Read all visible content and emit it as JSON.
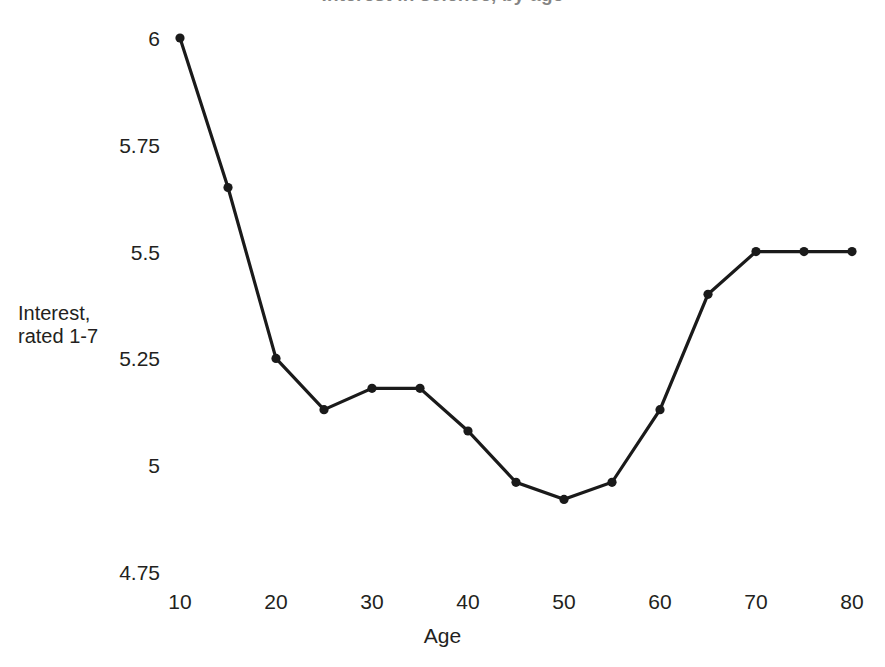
{
  "chart_data": {
    "type": "line",
    "title": "Interest in science, by age",
    "title_cropped": true,
    "xlabel": "Age",
    "ylabel": "Interest,\nrated 1-7",
    "ylabel_line1": "Interest,",
    "ylabel_line2": "rated 1-7",
    "x": [
      10,
      15,
      20,
      25,
      30,
      35,
      40,
      45,
      50,
      55,
      60,
      65,
      70,
      75,
      80
    ],
    "values": [
      6.0,
      5.65,
      5.25,
      5.13,
      5.18,
      5.18,
      5.08,
      4.96,
      4.92,
      4.96,
      5.13,
      5.4,
      5.5,
      5.5,
      5.5
    ],
    "series": [
      {
        "name": "Interest",
        "values": [
          6.0,
          5.65,
          5.25,
          5.13,
          5.18,
          5.18,
          5.08,
          4.96,
          4.92,
          4.96,
          5.13,
          5.4,
          5.5,
          5.5,
          5.5
        ]
      }
    ],
    "xlim": [
      10,
      80
    ],
    "ylim": [
      4.75,
      6.0
    ],
    "xticks": [
      10,
      20,
      30,
      40,
      50,
      60,
      70,
      80
    ],
    "xticklabels": [
      "10",
      "20",
      "30",
      "40",
      "50",
      "60",
      "70",
      "80"
    ],
    "yticks": [
      4.75,
      5.0,
      5.25,
      5.5,
      5.75,
      6.0
    ],
    "yticklabels": [
      "4.75",
      "5",
      "5.25",
      "5.5",
      "5.75",
      "6"
    ],
    "grid": false,
    "legend": null,
    "marker": "circle",
    "line_color": "#1a1a1a",
    "marker_color": "#1a1a1a",
    "background_color": "#ffffff"
  }
}
